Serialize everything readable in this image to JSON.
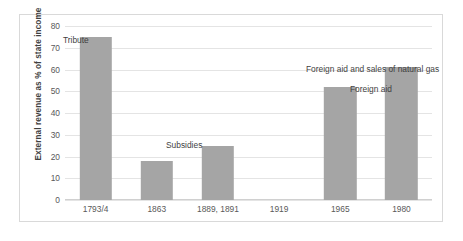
{
  "chart_data": {
    "type": "bar",
    "title": "",
    "xlabel": "",
    "ylabel": "External revenue as % of state income",
    "ylim": [
      0,
      80
    ],
    "yticks": [
      0,
      10,
      20,
      30,
      40,
      50,
      60,
      70,
      80
    ],
    "grid": true,
    "legend": "none",
    "bar_color": "#a5a5a5",
    "gridline_color": "#e4e4e4",
    "border_color": "#d9d9d9",
    "tick_label_color": "#595959",
    "annotation_color": "#3f3f3f",
    "categories": [
      "1793/4",
      "1863",
      "1889, 1891",
      "1919",
      "1965",
      "1980"
    ],
    "values": [
      75,
      18,
      25,
      0,
      52,
      61
    ],
    "annotations": [
      {
        "text": "Tribute",
        "category": "1793/4"
      },
      {
        "text": "Subsidies",
        "category": "1863"
      },
      {
        "text": "Foreign aid",
        "category": "1965"
      },
      {
        "text": "Foreign aid and sales of natural gas",
        "category": "1980"
      }
    ]
  }
}
